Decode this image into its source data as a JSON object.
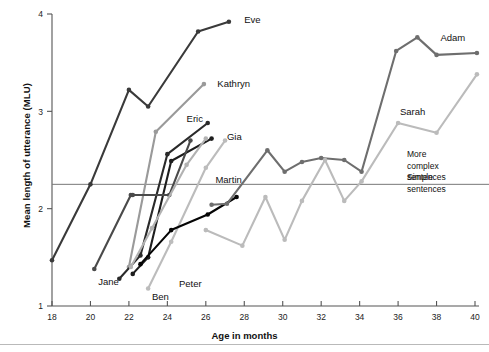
{
  "chart_data": {
    "type": "line",
    "title": "",
    "xlabel": "Age in months",
    "ylabel": "Mean length of utterance (MLU)",
    "xlim": [
      18,
      40
    ],
    "ylim": [
      1,
      4
    ],
    "xticks": [
      18,
      20,
      22,
      24,
      26,
      28,
      30,
      32,
      34,
      36,
      38,
      40
    ],
    "yticks": [
      1,
      2,
      3,
      4
    ],
    "grid": false,
    "legend": "inline-labels-at-line-ends",
    "reference_line": {
      "y": 2.25,
      "label_above": "More complex sentences",
      "label_below": "Simple sentences"
    },
    "annotations": [
      {
        "text": "More complex sentences",
        "x": 40.3,
        "y": 2.65
      },
      {
        "text": "Simple sentences",
        "x": 40.3,
        "y": 2.0
      }
    ],
    "series": [
      {
        "name": "Eve",
        "color": "#3a3a3a",
        "x": [
          18,
          20,
          22,
          23,
          25.6,
          27.2
        ],
        "y": [
          1.47,
          2.25,
          3.22,
          3.05,
          3.82,
          3.92
        ]
      },
      {
        "name": "Kathryn",
        "color": "#9a9a9a",
        "x": [
          22,
          23.4,
          25.9
        ],
        "y": [
          1.4,
          2.79,
          3.28
        ]
      },
      {
        "name": "Eric",
        "color": "#2a2a2a",
        "x": [
          21.5,
          22.6,
          24.0,
          26.1
        ],
        "y": [
          1.28,
          1.52,
          2.56,
          2.88
        ]
      },
      {
        "name": "Gia",
        "color": "#1d1d1d",
        "x": [
          22.2,
          23.0,
          24.2,
          26.3
        ],
        "y": [
          1.33,
          1.5,
          2.49,
          2.72
        ]
      },
      {
        "name": "Jane",
        "color": "#4a4a4a",
        "x": [
          20.2,
          22.1,
          22.2,
          24.1,
          25.2
        ],
        "y": [
          1.38,
          2.14,
          2.14,
          2.14,
          2.7
        ]
      },
      {
        "name": "Peter",
        "color": "#b2b2b2",
        "x": [
          22.1,
          23.2,
          25.0,
          26.0
        ],
        "y": [
          1.4,
          1.8,
          2.45,
          2.72
        ]
      },
      {
        "name": "Ben",
        "color": "#bcbcbc",
        "x": [
          23.0,
          24.2,
          26.0,
          27.0
        ],
        "y": [
          1.18,
          1.66,
          2.42,
          2.7
        ]
      },
      {
        "name": "Martin",
        "color": "#050505",
        "x": [
          22.6,
          24.2,
          26.1,
          27.6
        ],
        "y": [
          1.43,
          1.78,
          1.94,
          2.12
        ]
      },
      {
        "name": "Adam",
        "color": "#6e6e6e",
        "x": [
          26.3,
          27.1,
          29.2,
          30.1,
          31.0,
          32.0,
          33.2,
          34.1,
          35.9,
          37.0,
          38.0,
          40.1
        ],
        "y": [
          2.04,
          2.05,
          2.6,
          2.38,
          2.48,
          2.52,
          2.5,
          2.38,
          3.62,
          3.76,
          3.58,
          3.6
        ]
      },
      {
        "name": "Sarah",
        "color": "#bbbbbb",
        "x": [
          26.0,
          27.9,
          29.1,
          30.1,
          31.0,
          32.2,
          33.2,
          34.1,
          36.0,
          38.0,
          40.1
        ],
        "y": [
          1.78,
          1.62,
          2.12,
          1.68,
          2.08,
          2.5,
          2.08,
          2.28,
          2.88,
          2.78,
          3.38
        ]
      }
    ],
    "series_label_positions": [
      {
        "name": "Eve",
        "x": 28.0,
        "y": 3.94,
        "anchor": "start"
      },
      {
        "name": "Kathryn",
        "x": 26.6,
        "y": 3.29,
        "anchor": "start"
      },
      {
        "name": "Eric",
        "x": 25.0,
        "y": 2.93,
        "anchor": "start"
      },
      {
        "name": "Gia",
        "x": 27.1,
        "y": 2.74,
        "anchor": "start"
      },
      {
        "name": "Martin",
        "x": 26.5,
        "y": 2.3,
        "anchor": "start"
      },
      {
        "name": "Jane",
        "x": 20.4,
        "y": 1.25,
        "anchor": "start"
      },
      {
        "name": "Peter",
        "x": 24.6,
        "y": 1.23,
        "anchor": "start"
      },
      {
        "name": "Ben",
        "x": 23.2,
        "y": 1.1,
        "anchor": "start"
      },
      {
        "name": "Adam",
        "x": 38.2,
        "y": 3.76,
        "anchor": "start"
      },
      {
        "name": "Sarah",
        "x": 36.1,
        "y": 3.0,
        "anchor": "start"
      }
    ]
  },
  "axes": {
    "ylabel": "Mean length of utterance (MLU)",
    "xlabel": "Age in months"
  },
  "colors": {
    "axis": "#555555",
    "reference_line": "#777777",
    "background": "#ffffff",
    "text": "#111111"
  }
}
